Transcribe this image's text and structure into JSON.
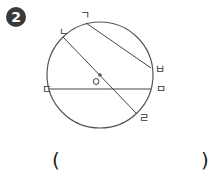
{
  "problem": {
    "number": "2",
    "answer_open": "(",
    "answer_close": ")",
    "answer_value": ""
  },
  "diagram": {
    "circle": {
      "cx": 100,
      "cy": 75,
      "r": 53,
      "stroke": "#555555"
    },
    "center": {
      "x": 100,
      "y": 75,
      "label": "ㅇ"
    },
    "segments": [
      {
        "name": "chord-giyeok-bieup",
        "from": "ㄱ",
        "to": "ㅂ",
        "x1": 86,
        "y1": 23,
        "x2": 151,
        "y2": 68
      },
      {
        "name": "diameter-nieun-rieul",
        "from": "ㄴ",
        "to": "ㄹ",
        "x1": 63,
        "y1": 37,
        "x2": 137,
        "y2": 114
      },
      {
        "name": "chord-digeut-mieum",
        "from": "ㄷ",
        "to": "ㅁ",
        "x1": 49,
        "y1": 89,
        "x2": 151,
        "y2": 89
      }
    ],
    "labels": [
      {
        "text": "ㄱ",
        "x": 80,
        "y": 19
      },
      {
        "text": "ㄴ",
        "x": 59,
        "y": 36
      },
      {
        "text": "ㄷ",
        "x": 42,
        "y": 93
      },
      {
        "text": "ㄹ",
        "x": 139,
        "y": 122
      },
      {
        "text": "ㅁ",
        "x": 156,
        "y": 93
      },
      {
        "text": "ㅂ",
        "x": 155,
        "y": 73
      }
    ]
  }
}
